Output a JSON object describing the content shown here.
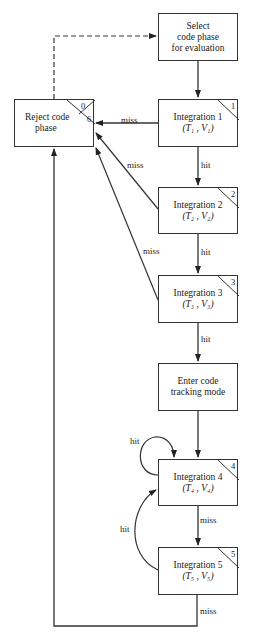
{
  "nodes": {
    "select": {
      "lines": [
        "Select",
        "code phase",
        "for evaluation"
      ]
    },
    "reject": {
      "lines": [
        "Reject code",
        "phase"
      ],
      "corner_top": "0",
      "corner_bottom": "6"
    },
    "int1": {
      "title": "Integration 1",
      "params": "(T₁ , V₁)",
      "corner": "1"
    },
    "int2": {
      "title": "Integration 2",
      "params": "(T₂ , V₂)",
      "corner": "2"
    },
    "int3": {
      "title": "Integration 3",
      "params": "(T₃ , V₃)",
      "corner": "3"
    },
    "enter": {
      "lines": [
        "Enter code",
        "tracking mode"
      ]
    },
    "int4": {
      "title": "Integration 4",
      "params": "(T₄ , V₄)",
      "corner": "4"
    },
    "int5": {
      "title": "Integration 5",
      "params": "(T₅ , V₅)",
      "corner": "5"
    }
  },
  "edges": {
    "int1_miss": "miss",
    "int1_hit": "hit",
    "int2_miss": "miss",
    "int2_hit": "hit",
    "int3_miss": "miss",
    "int3_hit": "hit",
    "int4_hit_loop": "hit",
    "int4_miss": "miss",
    "int5_hit": "hit",
    "int5_miss": "miss"
  },
  "colors": {
    "line": "#333333",
    "background": "#ffffff"
  }
}
